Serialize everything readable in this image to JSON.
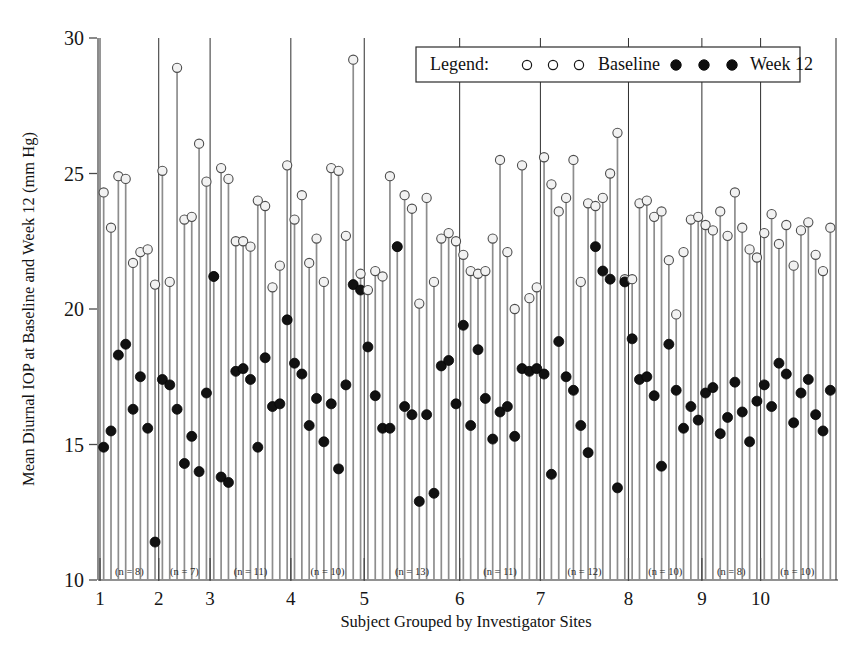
{
  "chart_data": {
    "type": "scatter",
    "title": "",
    "subtitle": "",
    "xlabel": "Subject Grouped by Investigator Sites",
    "ylabel": "Mean Diurnal IOP at Baseline and Week 12 (mm Hg)",
    "ylim": [
      10,
      30
    ],
    "yticks": [
      10,
      15,
      20,
      25,
      30
    ],
    "ytick_labels": [
      "10",
      "15",
      "20",
      "25",
      "30"
    ],
    "xticks": [
      1,
      2,
      3,
      4,
      5,
      6,
      7,
      8,
      9,
      10
    ],
    "xtick_labels": [
      "1",
      "2",
      "3",
      "4",
      "5",
      "6",
      "7",
      "8",
      "9",
      "10"
    ],
    "grid": false,
    "legend_position": "top-right",
    "legend_title": "Legend:",
    "series": [
      {
        "name": "Baseline",
        "marker": "open-circle",
        "color": "#f2f2f2",
        "edge_color": "#4c4c4c"
      },
      {
        "name": "Week 12",
        "marker": "filled-circle",
        "color": "#111111",
        "edge_color": "#050505"
      }
    ],
    "groups": [
      {
        "site": "1",
        "n_label": "(n = 8)",
        "n": 8,
        "baseline": [
          24.3,
          23.0,
          24.9,
          24.8,
          21.7,
          22.1,
          22.2,
          20.9
        ],
        "week12": [
          14.9,
          15.5,
          18.3,
          18.7,
          16.3,
          17.5,
          15.6,
          11.4
        ]
      },
      {
        "site": "2",
        "n_label": "(n = 7)",
        "n": 7,
        "baseline": [
          25.1,
          21.0,
          28.9,
          23.3,
          23.4,
          26.1,
          24.7
        ],
        "week12": [
          17.4,
          17.2,
          16.3,
          14.3,
          15.3,
          14.0,
          16.9
        ]
      },
      {
        "site": "3",
        "n_label": "(n = 11)",
        "n": 11,
        "baseline": [
          21.2,
          25.2,
          24.8,
          22.5,
          22.5,
          22.3,
          24.0,
          23.8,
          20.8,
          21.6,
          25.3
        ],
        "week12": [
          21.2,
          13.8,
          13.6,
          17.7,
          17.8,
          17.4,
          14.9,
          18.2,
          16.4,
          16.5,
          19.6
        ]
      },
      {
        "site": "4",
        "n_label": "(n = 10)",
        "n": 10,
        "baseline": [
          23.3,
          24.2,
          21.7,
          22.6,
          21.0,
          25.2,
          25.1,
          22.7,
          29.2,
          21.3
        ],
        "week12": [
          18.0,
          17.6,
          15.7,
          16.7,
          15.1,
          16.5,
          14.1,
          17.2,
          20.9,
          20.7
        ]
      },
      {
        "site": "5",
        "n_label": "(n = 13)",
        "n": 13,
        "baseline": [
          20.7,
          21.4,
          21.2,
          24.9,
          22.3,
          24.2,
          23.7,
          20.2,
          24.1,
          21.0,
          22.6,
          22.8,
          22.5
        ],
        "week12": [
          18.6,
          16.8,
          15.6,
          15.6,
          22.3,
          16.4,
          16.1,
          12.9,
          16.1,
          13.2,
          17.9,
          18.1,
          16.5
        ]
      },
      {
        "site": "6",
        "n_label": "(n = 11)",
        "n": 11,
        "baseline": [
          22.0,
          21.4,
          21.3,
          21.4,
          22.6,
          25.5,
          22.1,
          20.0,
          25.3,
          20.4,
          20.8
        ],
        "week12": [
          19.4,
          15.7,
          18.5,
          16.7,
          15.2,
          16.2,
          16.4,
          15.3,
          17.8,
          17.7,
          17.8
        ]
      },
      {
        "site": "7",
        "n_label": "(n = 12)",
        "n": 12,
        "baseline": [
          25.6,
          24.6,
          23.6,
          24.1,
          25.5,
          21.0,
          23.9,
          23.8,
          24.1,
          25.0,
          26.5,
          21.1
        ],
        "week12": [
          17.6,
          13.9,
          18.8,
          17.5,
          17.0,
          15.7,
          14.7,
          22.3,
          21.4,
          21.1,
          13.4,
          21.0
        ]
      },
      {
        "site": "8",
        "n_label": "(n = 10)",
        "n": 10,
        "baseline": [
          21.1,
          23.9,
          24.0,
          23.4,
          23.6,
          21.8,
          19.8,
          22.1,
          23.3,
          23.4
        ],
        "week12": [
          18.9,
          17.4,
          17.5,
          16.8,
          14.2,
          18.7,
          17.0,
          15.6,
          16.4,
          15.9
        ]
      },
      {
        "site": "9",
        "n_label": "(n = 8)",
        "n": 8,
        "baseline": [
          23.1,
          22.9,
          23.6,
          22.7,
          24.3,
          23.0,
          22.2,
          21.9
        ],
        "week12": [
          16.9,
          17.1,
          15.4,
          16.0,
          17.3,
          16.2,
          15.1,
          16.6
        ]
      },
      {
        "site": "10",
        "n_label": "(n = 10)",
        "n": 10,
        "baseline": [
          22.8,
          23.5,
          22.4,
          23.1,
          21.6,
          22.9,
          23.2,
          22.0,
          21.4,
          23.0
        ],
        "week12": [
          17.2,
          16.4,
          18.0,
          17.6,
          15.8,
          16.9,
          17.4,
          16.1,
          15.5,
          17.0
        ]
      }
    ]
  },
  "legend": {
    "title": "Legend:",
    "baseline_label": "Baseline",
    "week12_label": "Week 12",
    "baseline_marker": "open-circle-icon",
    "week12_marker": "filled-circle-icon"
  },
  "axes": {
    "y_title": "Mean Diurnal IOP at Baseline and Week 12 (mm Hg)",
    "x_title": "Subject Grouped by Investigator Sites"
  }
}
